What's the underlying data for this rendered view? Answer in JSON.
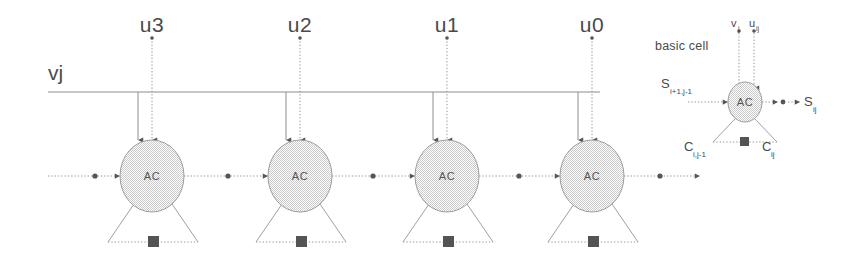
{
  "figure": {
    "vj_label": "vj",
    "basic_cell_label": "basic cell",
    "cell_label": "AC",
    "colors": {
      "ink": "#4a4a4a",
      "wire": "#8d8d8d",
      "node": "#555555",
      "cell_fill": "#d8d8d8",
      "background": "#ffffff"
    }
  },
  "inputs": [
    {
      "label": "u3",
      "x": 152
    },
    {
      "label": "u2",
      "x": 300
    },
    {
      "label": "u1",
      "x": 447
    },
    {
      "label": "u0",
      "x": 592
    }
  ],
  "cells": [
    {
      "label": "AC",
      "cx": 152,
      "cy": 176
    },
    {
      "label": "AC",
      "cx": 300,
      "cy": 176
    },
    {
      "label": "AC",
      "cx": 447,
      "cy": 176
    },
    {
      "label": "AC",
      "cx": 592,
      "cy": 176
    }
  ],
  "basic_cell": {
    "title": "basic cell",
    "cell_label": "AC",
    "inputs_top": [
      {
        "symbol": "v",
        "subscript": "j"
      },
      {
        "symbol": "u",
        "subscript": "ij"
      }
    ],
    "input_left": {
      "symbol": "S",
      "subscript": "i+1,j-1"
    },
    "output_right": {
      "symbol": "S",
      "subscript": "ij"
    },
    "carry_left": {
      "symbol": "C",
      "subscript": "i,j-1"
    },
    "carry_right": {
      "symbol": "C",
      "subscript": "ij"
    }
  }
}
